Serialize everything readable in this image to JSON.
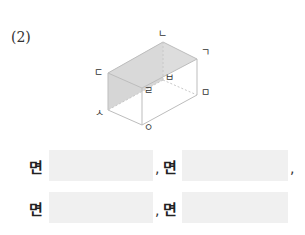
{
  "question": {
    "number": "(2)"
  },
  "figure": {
    "type": "rectangular-prism",
    "shaded_face": "ㄴㄷㅅ... (left diagonal face ㄷㄴ-ㄹ-ㅅ region)",
    "vertex_labels": {
      "top_back": "ㄴ",
      "top_right": "ㄱ",
      "top_left": "ㄷ",
      "mid_hidden": "ㅂ",
      "front_top": "ㄹ",
      "right_bottom": "ㅁ",
      "left_bottom": "ㅅ",
      "front_bottom": "ㅇ"
    },
    "colors": {
      "edge": "#bdbdbd",
      "shade": "#d6d6d6",
      "hidden": "#c8c8c8"
    }
  },
  "answers": {
    "word": "면",
    "separator": ",",
    "rows": [
      {
        "items": [
          {
            "label": "면",
            "value": ""
          },
          {
            "label": "면",
            "value": ""
          }
        ],
        "trailing": ","
      },
      {
        "items": [
          {
            "label": "면",
            "value": ""
          },
          {
            "label": "면",
            "value": ""
          }
        ],
        "trailing": ""
      }
    ]
  }
}
